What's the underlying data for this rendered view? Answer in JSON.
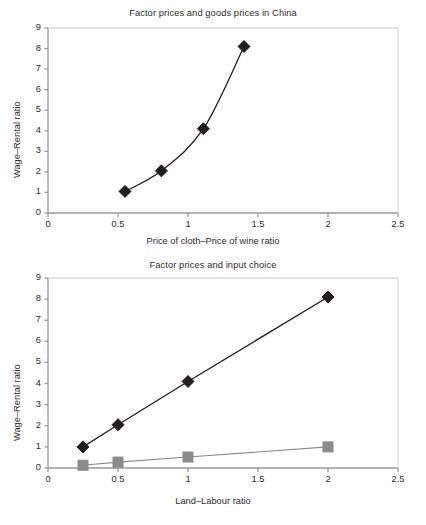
{
  "page": {
    "background": "#ffffff",
    "series_colors": {
      "black_series": "#231f20",
      "gray_series": "#8b8b8b",
      "axis": "#9a9a9a",
      "text": "#2b2b2b"
    }
  },
  "figures": [
    {
      "id": "figure-top",
      "title": "Factor prices and goods prices in China",
      "xlabel": "Price of cloth–Price of wine ratio",
      "ylabel": "Wage–Rental ratio",
      "xticks": [
        "0",
        "0.5",
        "1",
        "1.5",
        "2",
        "2.5"
      ],
      "yticks": [
        "0",
        "1",
        "2",
        "3",
        "4",
        "5",
        "6",
        "7",
        "8",
        "9"
      ]
    },
    {
      "id": "figure-bottom",
      "title": "Factor prices and input choice",
      "xlabel": "Land–Labour ratio",
      "ylabel": "Wage–Rental ratio",
      "xticks": [
        "0",
        "0.5",
        "1",
        "1.5",
        "2",
        "2.5"
      ],
      "yticks": [
        "0",
        "1",
        "2",
        "3",
        "4",
        "5",
        "6",
        "7",
        "8",
        "9"
      ]
    }
  ],
  "chart_data": [
    {
      "type": "line",
      "title": "Factor prices and goods prices in China",
      "xlabel": "Price of cloth–Price of wine ratio",
      "ylabel": "Wage–Rental ratio",
      "xlim": [
        0,
        2.5
      ],
      "ylim": [
        0,
        9
      ],
      "xticks": [
        0,
        0.5,
        1,
        1.5,
        2,
        2.5
      ],
      "yticks": [
        0,
        1,
        2,
        3,
        4,
        5,
        6,
        7,
        8,
        9
      ],
      "grid": false,
      "legend": "none",
      "smoothing": "spline",
      "series": [
        {
          "name": "Wage–Rental ratio vs goods price ratio",
          "marker": "diamond",
          "color": "#231f20",
          "x": [
            0.55,
            0.81,
            1.11,
            1.4
          ],
          "y": [
            1.05,
            2.05,
            4.1,
            8.1
          ]
        }
      ]
    },
    {
      "type": "line",
      "title": "Factor prices and input choice",
      "xlabel": "Land–Labour ratio",
      "ylabel": "Wage–Rental ratio",
      "xlim": [
        0,
        2.5
      ],
      "ylim": [
        0,
        9
      ],
      "xticks": [
        0,
        0.5,
        1,
        1.5,
        2,
        2.5
      ],
      "yticks": [
        0,
        1,
        2,
        3,
        4,
        5,
        6,
        7,
        8,
        9
      ],
      "grid": false,
      "legend": "none",
      "series": [
        {
          "name": "Cloth sector land–labour ratio",
          "marker": "diamond",
          "color": "#231f20",
          "x": [
            0.25,
            0.5,
            1.0,
            2.0
          ],
          "y": [
            1.0,
            2.05,
            4.1,
            8.1
          ]
        },
        {
          "name": "Wine sector land–labour ratio",
          "marker": "square",
          "color": "#8b8b8b",
          "x": [
            0.25,
            0.5,
            1.0,
            2.0
          ],
          "y": [
            0.13,
            0.28,
            0.52,
            1.0
          ]
        }
      ]
    }
  ]
}
